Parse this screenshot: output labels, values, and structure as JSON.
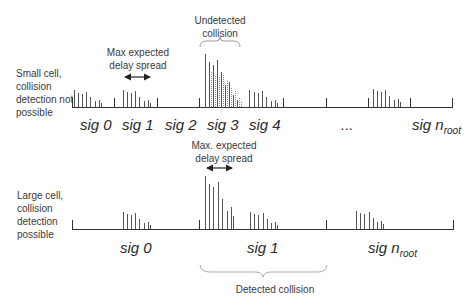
{
  "top_panel": {
    "side_label": [
      "Small cell,",
      "collision",
      "detection not",
      "possible"
    ],
    "annotation_delay": [
      "Max expected",
      "delay spread"
    ],
    "annotation_collision": [
      "Undetected",
      "collision"
    ],
    "signatures": [
      "sig 0",
      "sig 1",
      "sig 2",
      "sig 3",
      "sig 4",
      "...",
      "sig n"
    ],
    "last_sub": "root"
  },
  "bottom_panel": {
    "side_label": [
      "Large cell,",
      "collision",
      "detection",
      "possible"
    ],
    "annotation_delay": [
      "Max. expected",
      "delay spread"
    ],
    "annotation_collision": "Detected collision",
    "signatures": [
      "sig 0",
      "sig 1",
      "sig n"
    ],
    "last_sub": "root"
  },
  "colors": {
    "line": "#333333",
    "text": "#3a3a3a",
    "brace": "#999999"
  }
}
